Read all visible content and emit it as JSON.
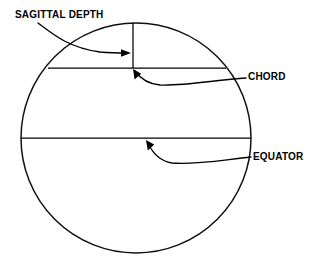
{
  "figure": {
    "type": "technical-line-diagram",
    "background_color": "#ffffff",
    "line_color": "#000000",
    "canvas": {
      "width": 318,
      "height": 259
    }
  },
  "labels": {
    "sagittal_depth": "SAGITTAL DEPTH",
    "chord": "CHORD",
    "equator": "EQUATOR"
  },
  "geometry": {
    "circle": {
      "name": "lens-circle",
      "center_x": 136,
      "center_y": 138,
      "radius": 115
    },
    "chord_line": {
      "name": "chord-line",
      "x1": 48,
      "y1": 68,
      "x2": 226,
      "y2": 68
    },
    "equator_line": {
      "name": "equator-line",
      "x1": 21,
      "y1": 138,
      "x2": 251,
      "y2": 138
    },
    "sagittal_depth_line": {
      "name": "sagittal-depth-line",
      "x": 133,
      "y_top": 23,
      "y_bottom": 68
    }
  },
  "leaders": {
    "sagittal_depth": {
      "path": "M 38 23 C 55 36, 70 48, 100 52 C 112 53, 120 53, 128 53",
      "arrow_tip_x": 131,
      "arrow_tip_y": 53,
      "arrow_direction": "right"
    },
    "chord": {
      "path": "M 246 78 C 215 80, 185 86, 160 85 C 148 84, 140 78, 135 71",
      "arrow_tip_x": 133,
      "arrow_tip_y": 69,
      "arrow_direction": "up-left"
    },
    "equator": {
      "path": "M 251 157 C 222 160, 195 165, 172 163 C 160 161, 152 152, 148 143",
      "arrow_tip_x": 146,
      "arrow_tip_y": 140,
      "arrow_direction": "up-left"
    }
  },
  "label_positions": {
    "sagittal_depth": {
      "x": 15,
      "y": 18
    },
    "chord": {
      "x": 248,
      "y": 80
    },
    "equator": {
      "x": 253,
      "y": 160
    }
  }
}
